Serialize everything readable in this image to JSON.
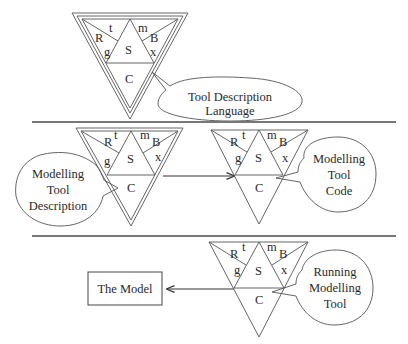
{
  "diagram": {
    "type": "tool-generation-pipeline",
    "tetrahedron_labels": {
      "top_left_a": "R",
      "top_left_b": "t",
      "top_left_c": "g",
      "top_right_a": "m",
      "top_right_b": "B",
      "top_right_c": "x",
      "center": "S",
      "bottom": "C"
    },
    "sections": [
      {
        "id": "language",
        "callout": [
          "Tool Description",
          "Language"
        ]
      },
      {
        "id": "description-to-code",
        "left_callout": [
          "Modelling",
          "Tool",
          "Description"
        ],
        "right_callout": [
          "Modelling",
          "Tool",
          "Code"
        ]
      },
      {
        "id": "running",
        "box_label": "The Model",
        "callout": [
          "Running",
          "Modelling",
          "Tool"
        ]
      }
    ],
    "colors": {
      "line": "#555555",
      "separator": "#777777",
      "text": "#2a2a2a",
      "background": "#ffffff"
    }
  }
}
